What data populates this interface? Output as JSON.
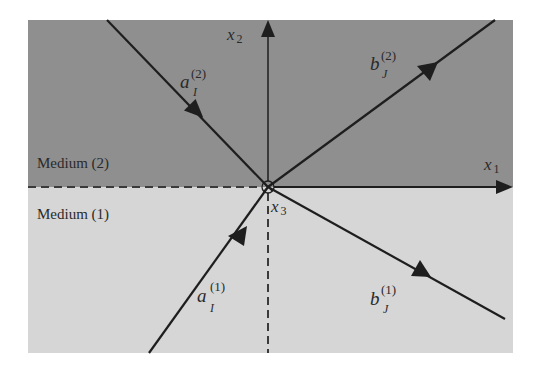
{
  "diagram": {
    "media": {
      "upper": {
        "label": "Medium (2)",
        "color": "#8f8f8f"
      },
      "lower": {
        "label": "Medium (1)",
        "color": "#d6d6d6"
      }
    },
    "axes": {
      "x1": {
        "base": "x",
        "sub": "1"
      },
      "x2": {
        "base": "x",
        "sub": "2"
      },
      "x3": {
        "base": "x",
        "sub": "3"
      }
    },
    "waves": [
      {
        "id": "aI2",
        "base": "a",
        "sub": "I",
        "sup": "(2)",
        "kind": "incident",
        "medium": "2"
      },
      {
        "id": "bJ2",
        "base": "b",
        "sub": "J",
        "sup": "(2)",
        "kind": "outgoing",
        "medium": "2"
      },
      {
        "id": "aI1",
        "base": "a",
        "sub": "I",
        "sup": "(1)",
        "kind": "incident",
        "medium": "1"
      },
      {
        "id": "bJ1",
        "base": "b",
        "sub": "J",
        "sup": "(1)",
        "kind": "outgoing",
        "medium": "1"
      }
    ],
    "colors": {
      "line": "#1e1e1e",
      "upper": "#8f8f8f",
      "lower": "#d6d6d6"
    }
  }
}
